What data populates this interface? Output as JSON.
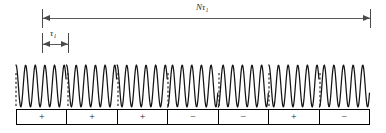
{
  "figure": {
    "background_color": "#ffffff",
    "line_color": "#1a1a1a",
    "dimension_color": "#5a5a5a"
  },
  "dimensions": {
    "total": {
      "label_prefix": "N",
      "label_symbol": "τ",
      "label_subscript": "1",
      "label_text": "Nτ₁",
      "start_x": 42,
      "end_x": 370,
      "y": 18
    },
    "subpulse": {
      "label_prefix": "",
      "label_symbol": "τ",
      "label_subscript": "1",
      "label_text": "τ₁",
      "start_x": 42,
      "end_x": 68,
      "y": 44
    }
  },
  "waveform": {
    "type": "phase-coded-carrier",
    "baseline_y": 86,
    "amplitude": 21,
    "left_x": 16,
    "right_x": 370,
    "cycles_per_subpulse": 5.25,
    "phase_flip_markers": [
      16,
      68,
      118,
      168,
      219,
      269,
      320
    ],
    "segment_phases_deg": [
      0,
      0,
      0,
      180,
      180,
      0,
      180
    ]
  },
  "code_sequence": {
    "length": 7,
    "cells": [
      {
        "sign": "+",
        "phase_deg": 0
      },
      {
        "sign": "+",
        "phase_deg": 0
      },
      {
        "sign": "+",
        "phase_deg": 0
      },
      {
        "sign": "−",
        "phase_deg": 180
      },
      {
        "sign": "−",
        "phase_deg": 180
      },
      {
        "sign": "+",
        "phase_deg": 0
      },
      {
        "sign": "−",
        "phase_deg": 180
      }
    ]
  },
  "chart_data": {
    "type": "line",
    "xlabel": "",
    "ylabel": "",
    "categories": [
      "1",
      "2",
      "3",
      "4",
      "5",
      "6",
      "7"
    ],
    "series": [
      {
        "name": "code",
        "values": [
          1,
          1,
          1,
          -1,
          -1,
          1,
          -1
        ]
      }
    ],
    "annotations": [
      "Nτ₁",
      "τ₁"
    ],
    "grid": false,
    "legend": "none"
  }
}
